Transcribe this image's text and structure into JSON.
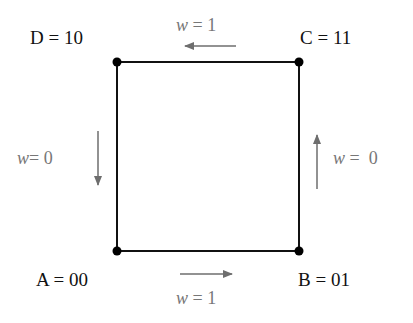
{
  "diagram": {
    "type": "state-transition",
    "colors": {
      "edge": "#111111",
      "node": "#000000",
      "arrow": "#6e6e6e",
      "label": "#111111",
      "edge_label": "#777777"
    },
    "nodes": [
      {
        "id": "A",
        "label": "A = 00",
        "position": "bottom-left"
      },
      {
        "id": "B",
        "label": "B  = 01",
        "position": "bottom-right"
      },
      {
        "id": "C",
        "label": "C = 11",
        "position": "top-right"
      },
      {
        "id": "D",
        "label": "D = 10",
        "position": "top-left"
      }
    ],
    "transitions": [
      {
        "from": "A",
        "to": "B",
        "var": "w",
        "eq": " = 1",
        "direction": "right",
        "side": "bottom"
      },
      {
        "from": "B",
        "to": "C",
        "var": "w",
        "eq": " =  0",
        "direction": "up",
        "side": "right"
      },
      {
        "from": "C",
        "to": "D",
        "var": "w",
        "eq": " = 1",
        "direction": "left",
        "side": "top"
      },
      {
        "from": "D",
        "to": "A",
        "var": "w",
        "eq": "= 0",
        "direction": "down",
        "side": "left"
      }
    ]
  }
}
